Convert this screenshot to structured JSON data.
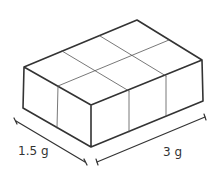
{
  "diagram": {
    "grid": {
      "rows": 2,
      "columns": 3
    },
    "dimensions": {
      "depth_label": "1.5 g",
      "width_label": "3 g"
    },
    "colors": {
      "stroke": "#333333",
      "inner_stroke": "#555555",
      "background": "#ffffff"
    }
  }
}
